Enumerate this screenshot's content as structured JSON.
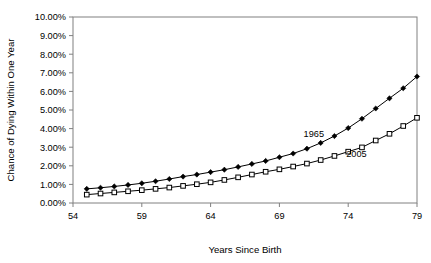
{
  "chart_data": {
    "type": "line",
    "title": "",
    "xlabel": "Years Since Birth",
    "ylabel": "Chance of Dying Within One Year",
    "xlim": [
      54,
      79
    ],
    "ylim": [
      0,
      10
    ],
    "xticks": [
      "54",
      "59",
      "64",
      "69",
      "74",
      "79"
    ],
    "xtick_values": [
      54,
      59,
      64,
      69,
      74,
      79
    ],
    "yticks": [
      "0.00%",
      "1.00%",
      "2.00%",
      "3.00%",
      "4.00%",
      "5.00%",
      "6.00%",
      "7.00%",
      "8.00%",
      "9.00%",
      "10.00%"
    ],
    "ytick_values": [
      0,
      1,
      2,
      3,
      4,
      5,
      6,
      7,
      8,
      9,
      10
    ],
    "grid": false,
    "legend_position": "inline-annotation",
    "x": [
      55,
      56,
      57,
      58,
      59,
      60,
      61,
      62,
      63,
      64,
      65,
      66,
      67,
      68,
      69,
      70,
      71,
      72,
      73,
      74,
      75,
      76,
      77,
      78,
      79
    ],
    "series": [
      {
        "name": "1965",
        "marker": "filled-diamond",
        "label_x": 71.5,
        "label_y": 3.55,
        "values": [
          0.76,
          0.82,
          0.89,
          0.97,
          1.06,
          1.17,
          1.29,
          1.42,
          1.53,
          1.66,
          1.79,
          1.94,
          2.1,
          2.26,
          2.46,
          2.66,
          2.92,
          3.23,
          3.6,
          4.03,
          4.53,
          5.08,
          5.63,
          6.17,
          6.8
        ]
      },
      {
        "name": "2005",
        "marker": "open-square",
        "label_x": 74.6,
        "label_y": 2.45,
        "values": [
          0.45,
          0.51,
          0.57,
          0.63,
          0.69,
          0.76,
          0.83,
          0.92,
          1.01,
          1.11,
          1.24,
          1.38,
          1.53,
          1.68,
          1.81,
          1.96,
          2.12,
          2.31,
          2.53,
          2.76,
          2.99,
          3.36,
          3.72,
          4.14,
          4.58
        ]
      }
    ]
  },
  "axes": {
    "y_axis_label": "Chance of Dying Within One Year",
    "x_axis_label": "Years Since Birth"
  },
  "colors": {
    "frame": "#808080",
    "line": "#000000",
    "marker_fill_1965": "#000000",
    "marker_fill_2005": "#ffffff",
    "background": "#ffffff"
  }
}
